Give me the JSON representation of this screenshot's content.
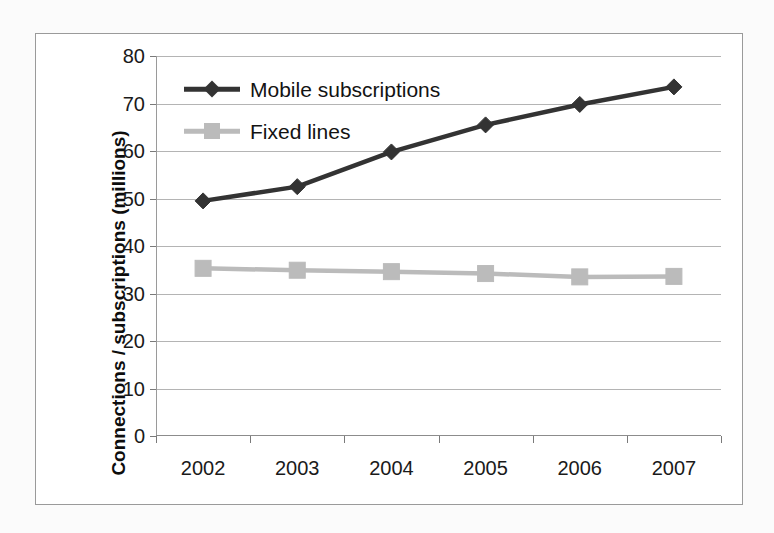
{
  "chart_data": {
    "type": "line",
    "title": "",
    "xlabel": "",
    "ylabel": "Connections / subscriptions (millions)",
    "categories": [
      "2002",
      "2003",
      "2004",
      "2005",
      "2006",
      "2007"
    ],
    "ylim": [
      0,
      80
    ],
    "ytick_step": 10,
    "yticks": [
      "80",
      "70",
      "60",
      "50",
      "40",
      "30",
      "20",
      "10",
      "0"
    ],
    "grid": true,
    "legend_position": "inside top-left",
    "series": [
      {
        "name": "Mobile subscriptions",
        "values": [
          49.5,
          52.5,
          59.8,
          65.5,
          69.8,
          73.5
        ],
        "color": "#333333",
        "marker": "diamond"
      },
      {
        "name": "Fixed lines",
        "values": [
          35.3,
          34.9,
          34.6,
          34.2,
          33.5,
          33.6
        ],
        "color": "#bbbbbb",
        "marker": "square"
      }
    ]
  },
  "figure": {
    "background_color": "#fbfbfb",
    "plot_background_color": "#ffffff",
    "border_color": "#9a9a9a",
    "gridline_color": "#b4b4b4"
  }
}
